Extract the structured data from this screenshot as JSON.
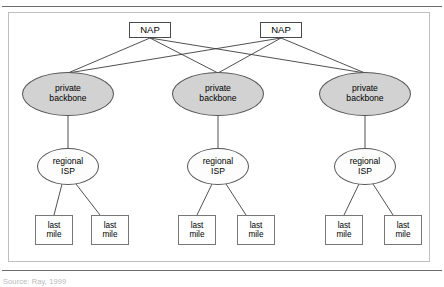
{
  "figure": {
    "source_caption": "Source: Ray, 1999",
    "frame_color": "#bfbfbf",
    "rule_color": "#6d6d6d",
    "backbone_fill": "#d2d2d2",
    "isp_fill": "#fdfdfd",
    "box_fill": "#ffffff",
    "line_color": "#3d3d3d"
  },
  "nodes": {
    "nap": [
      {
        "label": "NAP"
      },
      {
        "label": "NAP"
      }
    ],
    "backbones": [
      {
        "line1": "private",
        "line2": "backbone"
      },
      {
        "line1": "private",
        "line2": "backbone"
      },
      {
        "line1": "private",
        "line2": "backbone"
      }
    ],
    "isps": [
      {
        "line1": "regional",
        "line2": "ISP"
      },
      {
        "line1": "regional",
        "line2": "ISP"
      },
      {
        "line1": "regional",
        "line2": "ISP"
      }
    ],
    "last_mile": [
      {
        "line1": "last",
        "line2": "mile"
      },
      {
        "line1": "last",
        "line2": "mile"
      },
      {
        "line1": "last",
        "line2": "mile"
      },
      {
        "line1": "last",
        "line2": "mile"
      },
      {
        "line1": "last",
        "line2": "mile"
      },
      {
        "line1": "last",
        "line2": "mile"
      }
    ]
  }
}
